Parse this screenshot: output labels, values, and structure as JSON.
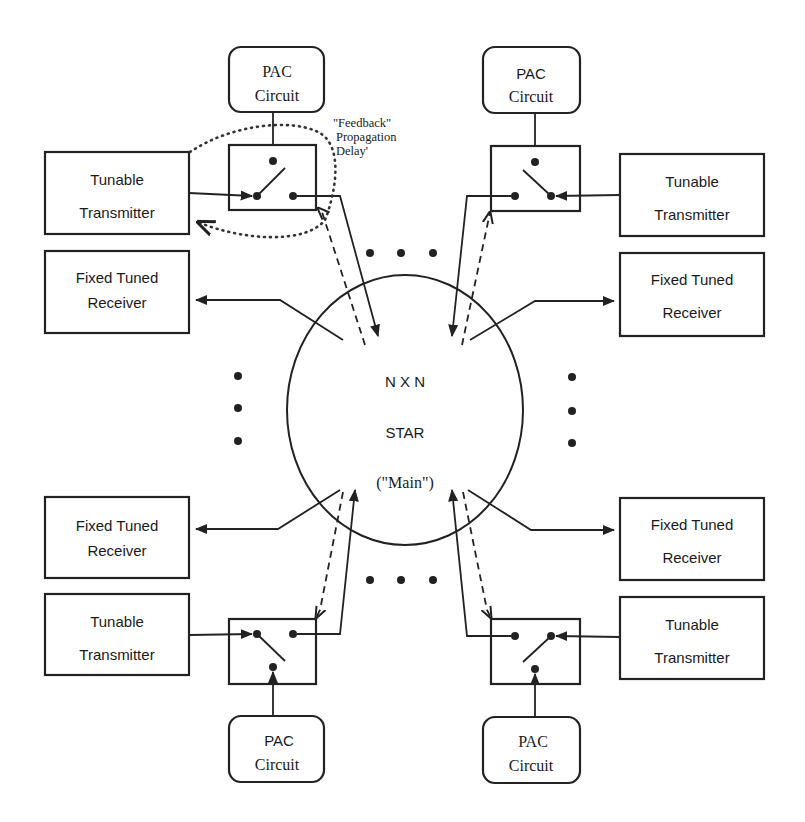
{
  "diagram": {
    "type": "network-architecture",
    "center_node": {
      "id": "star",
      "lines": [
        "N X N",
        "STAR",
        "(\"Main\")"
      ]
    },
    "nodes": [
      {
        "id": "pac-tl",
        "kind": "PAC",
        "lines": [
          "PAC",
          "Circuit"
        ]
      },
      {
        "id": "pac-tr",
        "kind": "PAC",
        "lines": [
          "PAC",
          "Circuit"
        ]
      },
      {
        "id": "pac-bl",
        "kind": "PAC",
        "lines": [
          "PAC",
          "Circuit"
        ]
      },
      {
        "id": "pac-br",
        "kind": "PAC",
        "lines": [
          "PAC",
          "Circuit"
        ]
      },
      {
        "id": "tx-tl",
        "kind": "transmitter",
        "lines": [
          "Tunable",
          "Transmitter"
        ]
      },
      {
        "id": "tx-tr",
        "kind": "transmitter",
        "lines": [
          "Tunable",
          "Transmitter"
        ]
      },
      {
        "id": "tx-bl",
        "kind": "transmitter",
        "lines": [
          "Tunable",
          "Transmitter"
        ]
      },
      {
        "id": "tx-br",
        "kind": "transmitter",
        "lines": [
          "Tunable",
          "Transmitter"
        ]
      },
      {
        "id": "rx-tl",
        "kind": "receiver",
        "lines": [
          "Fixed Tuned",
          "Receiver"
        ]
      },
      {
        "id": "rx-tr",
        "kind": "receiver",
        "lines": [
          "Fixed Tuned",
          "Receiver"
        ]
      },
      {
        "id": "rx-bl",
        "kind": "receiver",
        "lines": [
          "Fixed Tuned",
          "Receiver"
        ]
      },
      {
        "id": "rx-br",
        "kind": "receiver",
        "lines": [
          "Fixed Tuned",
          "Receiver"
        ]
      },
      {
        "id": "sw-tl",
        "kind": "switch"
      },
      {
        "id": "sw-tr",
        "kind": "switch"
      },
      {
        "id": "sw-bl",
        "kind": "switch"
      },
      {
        "id": "sw-br",
        "kind": "switch"
      }
    ],
    "edges": [
      {
        "from": "pac-tl",
        "to": "sw-tl",
        "style": "solid"
      },
      {
        "from": "tx-tl",
        "to": "sw-tl",
        "style": "solid"
      },
      {
        "from": "sw-tl",
        "to": "star",
        "style": "solid"
      },
      {
        "from": "star",
        "to": "sw-tl",
        "style": "dashed"
      },
      {
        "from": "star",
        "to": "rx-tl",
        "style": "solid"
      },
      {
        "from": "pac-tr",
        "to": "sw-tr",
        "style": "solid"
      },
      {
        "from": "tx-tr",
        "to": "sw-tr",
        "style": "solid"
      },
      {
        "from": "sw-tr",
        "to": "star",
        "style": "solid"
      },
      {
        "from": "star",
        "to": "sw-tr",
        "style": "dashed"
      },
      {
        "from": "star",
        "to": "rx-tr",
        "style": "solid"
      },
      {
        "from": "pac-bl",
        "to": "sw-bl",
        "style": "solid"
      },
      {
        "from": "tx-bl",
        "to": "sw-bl",
        "style": "solid"
      },
      {
        "from": "sw-bl",
        "to": "star",
        "style": "solid"
      },
      {
        "from": "star",
        "to": "sw-bl",
        "style": "dashed"
      },
      {
        "from": "star",
        "to": "rx-bl",
        "style": "solid"
      },
      {
        "from": "pac-br",
        "to": "sw-br",
        "style": "solid"
      },
      {
        "from": "tx-br",
        "to": "sw-br",
        "style": "solid"
      },
      {
        "from": "sw-br",
        "to": "star",
        "style": "solid"
      },
      {
        "from": "star",
        "to": "sw-br",
        "style": "dashed"
      },
      {
        "from": "star",
        "to": "rx-br",
        "style": "solid"
      },
      {
        "from": "sw-tl",
        "to": "tx-tl",
        "style": "dotted",
        "label": "feedback-delay"
      }
    ],
    "annotation": {
      "lines": [
        "\"Feedback\"",
        "Propagation",
        "Delay'"
      ]
    },
    "ellipsis_marker": "• • •"
  }
}
